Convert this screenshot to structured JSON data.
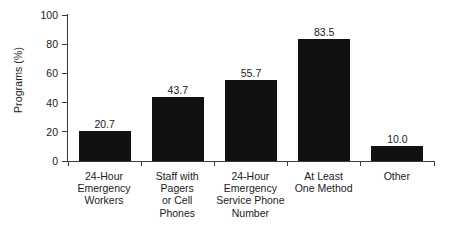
{
  "chart_data": {
    "type": "bar",
    "title": "",
    "xlabel": "",
    "ylabel": "Programs (%)",
    "categories": [
      "24-Hour Emergency Workers",
      "Staff with Pagers or Cell Phones",
      "24-Hour Emergency Service Phone Number",
      "At Least One Method",
      "Other"
    ],
    "category_lines": [
      [
        "24-Hour",
        "Emergency",
        "Workers"
      ],
      [
        "Staff with",
        "Pagers",
        "or Cell",
        "Phones"
      ],
      [
        "24-Hour",
        "Emergency",
        "Service Phone",
        "Number"
      ],
      [
        "At Least",
        "One Method"
      ],
      [
        "Other"
      ]
    ],
    "values": [
      20.7,
      43.7,
      55.7,
      83.5,
      10.0
    ],
    "value_labels": [
      "20.7",
      "43.7",
      "55.7",
      "83.5",
      "10.0"
    ],
    "ylim": [
      0,
      100
    ],
    "yticks": [
      0,
      20,
      40,
      60,
      80,
      100
    ],
    "ytick_labels": [
      "0",
      "20",
      "40",
      "60",
      "80",
      "100"
    ],
    "grid": false,
    "legend": null,
    "bar_color": "#111111",
    "axis_color": "#3b3b3b",
    "text_color": "#1a1a1a",
    "background": "#ffffff"
  }
}
